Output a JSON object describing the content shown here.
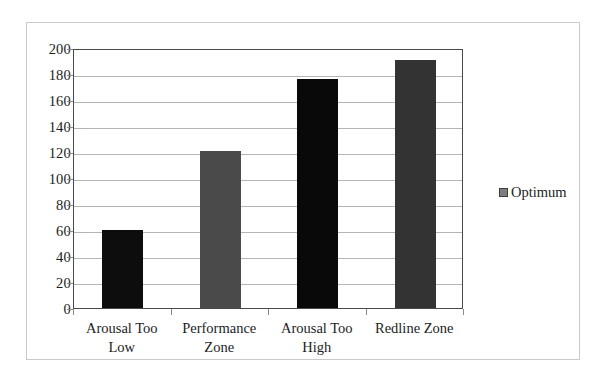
{
  "chart_data": {
    "type": "bar",
    "title": "",
    "xlabel": "",
    "ylabel": "",
    "categories": [
      "Arousal Too Low",
      "Performance Zone",
      "Arousal Too High",
      "Redline Zone"
    ],
    "series": [
      {
        "name": "Optimum",
        "values": [
          60,
          121,
          176,
          191
        ]
      }
    ],
    "bar_colors": [
      "#0d0d0d",
      "#4a4a4a",
      "#090909",
      "#333333"
    ],
    "ylim": [
      0,
      200
    ],
    "yticks": [
      0,
      20,
      40,
      60,
      80,
      100,
      120,
      140,
      160,
      180,
      200
    ],
    "ytick_labels": [
      "0",
      "20",
      "40",
      "60",
      "80",
      "100",
      "120",
      "140",
      "160",
      "180",
      "200"
    ],
    "grid": true,
    "legend": {
      "position": "right",
      "entries": [
        {
          "label": "Optimum",
          "color": "#7d7d7d"
        }
      ]
    },
    "axis_color": "#4a4a4a",
    "grid_color": "#b5b5b5",
    "frame_color": "#c9c9c9",
    "background": "#ffffff"
  },
  "legend": {
    "optimum_label": "Optimum"
  }
}
